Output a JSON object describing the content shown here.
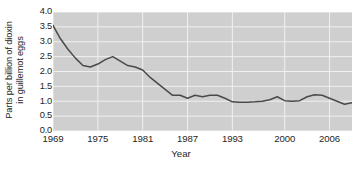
{
  "chart_data": {
    "type": "line",
    "title": "",
    "xlabel": "Year",
    "ylabel": "Parts per billion of dioxin in guillemot eggs",
    "ylabel_line1": "Parts per billion of dioxin",
    "ylabel_line2": "in guillemot eggs",
    "xlim": [
      1969,
      2009
    ],
    "ylim": [
      0.0,
      4.0
    ],
    "grid": true,
    "legend": "none",
    "line_color": "#4a4a4a",
    "plot_background": "#cfcfcf",
    "gridline_color": "#f0f0f0",
    "xticks": [
      1969,
      1975,
      1981,
      1987,
      1993,
      2000,
      2006
    ],
    "xtick_labels": [
      "1969",
      "1975",
      "1981",
      "1987",
      "1993",
      "2000",
      "2006"
    ],
    "yticks": [
      0.0,
      0.5,
      1.0,
      1.5,
      2.0,
      2.5,
      3.0,
      3.5,
      4.0
    ],
    "ytick_labels": [
      "0.0",
      "0.5",
      "1.0",
      "1.5",
      "2.0",
      "2.5",
      "3.0",
      "3.5",
      "4.0"
    ],
    "x": [
      1969,
      1970,
      1971,
      1972,
      1973,
      1974,
      1975,
      1976,
      1977,
      1978,
      1979,
      1980,
      1981,
      1982,
      1983,
      1984,
      1985,
      1986,
      1987,
      1988,
      1989,
      1990,
      1991,
      1992,
      1993,
      1994,
      1995,
      1996,
      1997,
      1998,
      1999,
      2000,
      2001,
      2002,
      2003,
      2004,
      2005,
      2006,
      2007,
      2008,
      2009
    ],
    "values": [
      3.55,
      3.1,
      2.75,
      2.45,
      2.2,
      2.15,
      2.25,
      2.4,
      2.5,
      2.35,
      2.2,
      2.15,
      2.05,
      1.8,
      1.6,
      1.4,
      1.2,
      1.2,
      1.1,
      1.2,
      1.15,
      1.2,
      1.2,
      1.1,
      0.98,
      0.97,
      0.97,
      0.98,
      1.0,
      1.05,
      1.15,
      1.02,
      1.0,
      1.02,
      1.15,
      1.22,
      1.2,
      1.1,
      1.0,
      0.9,
      0.95
    ],
    "series_name": "Dioxin concentration"
  }
}
